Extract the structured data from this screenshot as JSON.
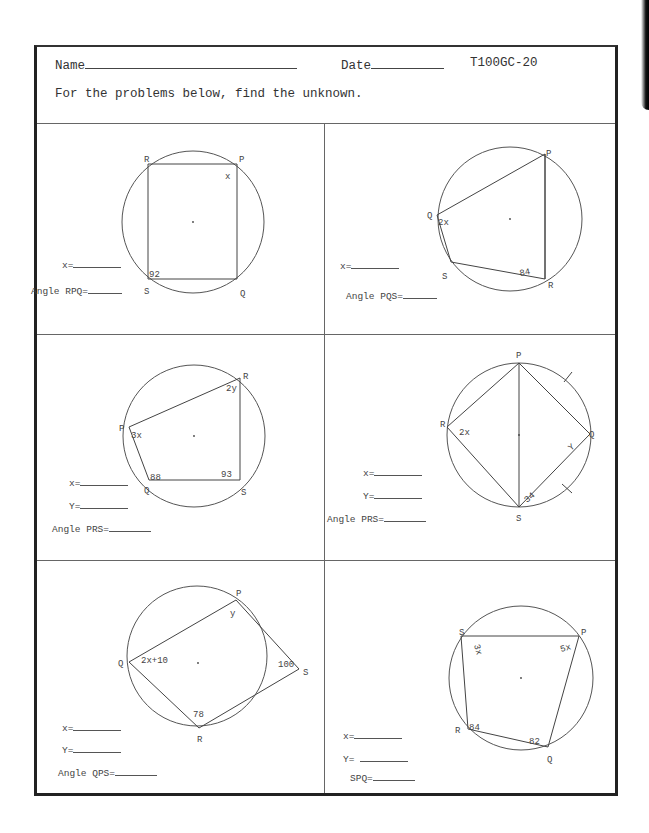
{
  "header": {
    "name_label": "Name",
    "date_label": "Date",
    "worksheet_code": "T100GC-20",
    "instructions": "For the problems below, find the unknown."
  },
  "problems": [
    {
      "id": 1,
      "vertices": {
        "P": "P",
        "Q": "Q",
        "R": "R",
        "S": "S"
      },
      "angle_labels": {
        "P": "x",
        "S": "92"
      },
      "answers": [
        {
          "label": "x="
        },
        {
          "label": "Angle RPQ="
        }
      ]
    },
    {
      "id": 2,
      "vertices": {
        "P": "P",
        "Q": "Q",
        "R": "R",
        "S": "S"
      },
      "angle_labels": {
        "Q": "2x",
        "R": "84"
      },
      "answers": [
        {
          "label": "x="
        },
        {
          "label": "Angle PQS="
        }
      ]
    },
    {
      "id": 3,
      "vertices": {
        "P": "P",
        "Q": "Q",
        "R": "R",
        "S": "S"
      },
      "angle_labels": {
        "P": "3x",
        "R": "2y",
        "Q": "88",
        "S": "93"
      },
      "answers": [
        {
          "label": "x="
        },
        {
          "label": "Y="
        },
        {
          "label": "Angle PRS="
        }
      ]
    },
    {
      "id": 4,
      "vertices": {
        "P": "P",
        "Q": "Q",
        "R": "R",
        "S": "S"
      },
      "angle_labels": {
        "R": "2x",
        "Q": "Y",
        "S": "34"
      },
      "answers": [
        {
          "label": "x="
        },
        {
          "label": "Y="
        },
        {
          "label": "Angle PRS="
        }
      ]
    },
    {
      "id": 5,
      "vertices": {
        "P": "P",
        "Q": "Q",
        "R": "R",
        "S": "S"
      },
      "angle_labels": {
        "P": "y",
        "Q": "2x+10",
        "S": "100",
        "R": "78"
      },
      "answers": [
        {
          "label": "x="
        },
        {
          "label": "Y="
        },
        {
          "label": "Angle QPS="
        }
      ]
    },
    {
      "id": 6,
      "vertices": {
        "P": "P",
        "Q": "Q",
        "R": "R",
        "S": "S"
      },
      "angle_labels": {
        "S": "3x",
        "P": "5x",
        "R": "84",
        "Q": "82"
      },
      "answers": [
        {
          "label": "x="
        },
        {
          "label": "Y= "
        },
        {
          "label": "SPQ="
        }
      ]
    }
  ]
}
